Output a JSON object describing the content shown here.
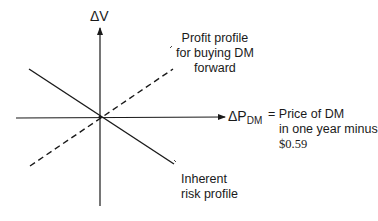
{
  "diagram": {
    "y_axis": {
      "symbol": "ΔV"
    },
    "x_axis": {
      "symbol": "ΔP",
      "subscript": "DM"
    },
    "x_axis_definition": {
      "equals": "=",
      "lines": [
        "Price of DM",
        "in one year minus",
        "$0.59"
      ]
    },
    "profit_profile_label": [
      "Profit profile",
      "for buying DM",
      "forward"
    ],
    "risk_profile_label": [
      "Inherent",
      "risk profile"
    ],
    "lines": [
      {
        "name": "inherent-risk-profile",
        "style": "solid",
        "from": [
          29,
          69
        ],
        "to": [
          174,
          164
        ]
      },
      {
        "name": "profit-profile-buying-dm-forward",
        "style": "dashed",
        "from": [
          30,
          166
        ],
        "to": [
          173,
          69
        ]
      }
    ],
    "colors": {
      "ink": "#1a1a1a",
      "background": "#ffffff"
    }
  }
}
